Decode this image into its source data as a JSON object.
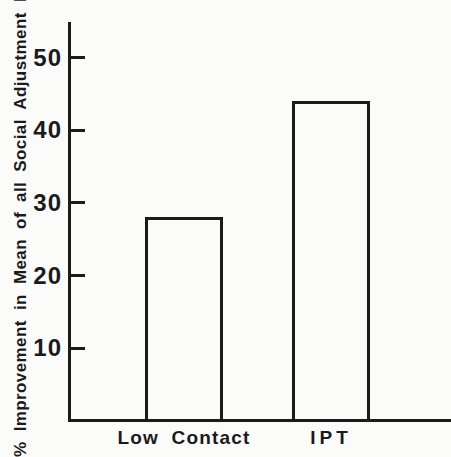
{
  "figure": {
    "background_color": "#fbfbfa",
    "ink_color": "#1b1b1b"
  },
  "chart_data": {
    "type": "bar",
    "title": "",
    "xlabel": "",
    "ylabel": "% Improvement in Mean of all Social Adjustment Items",
    "categories": [
      "Low Contact",
      "IPT"
    ],
    "values": [
      28,
      44
    ],
    "yticks": [
      10,
      20,
      30,
      40,
      50
    ],
    "ylim": [
      0,
      55
    ],
    "grid": false,
    "legend_position": "none",
    "bar_style": "outlined-unfilled"
  }
}
